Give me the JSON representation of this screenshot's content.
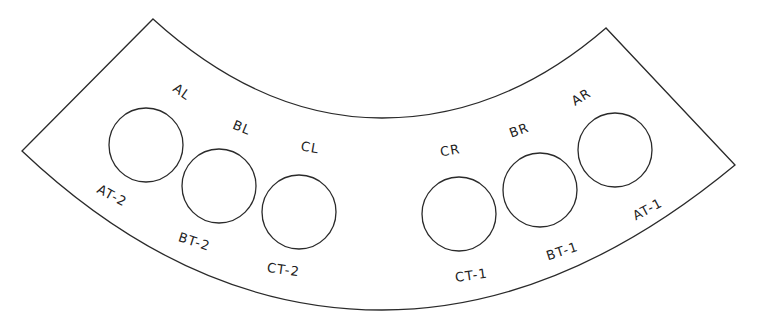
{
  "diagram": {
    "type": "curved-plate-layout",
    "stroke_color": "#2a2a2a",
    "background": "#ffffff",
    "plate": {
      "top_left": [
        153,
        19
      ],
      "left": [
        22,
        151
      ],
      "top_right": [
        606,
        28
      ],
      "right": [
        735,
        165
      ]
    },
    "holes": [
      {
        "id": "A-left",
        "cx": 146,
        "cy": 145,
        "r": 37,
        "top_label": "AL",
        "bottom_label": "AT-2"
      },
      {
        "id": "B-left",
        "cx": 219,
        "cy": 186,
        "r": 37,
        "top_label": "BL",
        "bottom_label": "BT-2"
      },
      {
        "id": "C-left",
        "cx": 299,
        "cy": 212,
        "r": 37,
        "top_label": "CL",
        "bottom_label": "CT-2"
      },
      {
        "id": "C-right",
        "cx": 459,
        "cy": 214,
        "r": 37,
        "top_label": "CR",
        "bottom_label": "CT-1"
      },
      {
        "id": "B-right",
        "cx": 540,
        "cy": 190,
        "r": 37,
        "top_label": "BR",
        "bottom_label": "BT-1"
      },
      {
        "id": "A-right",
        "cx": 615,
        "cy": 150,
        "r": 37,
        "top_label": "AR",
        "bottom_label": "AT-1"
      }
    ],
    "labels": {
      "AL": "AL",
      "BL": "BL",
      "CL": "CL",
      "CR": "CR",
      "BR": "BR",
      "AR": "AR",
      "AT2": "AT-2",
      "BT2": "BT-2",
      "CT2": "CT-2",
      "CT1": "CT-1",
      "BT1": "BT-1",
      "AT1": "AT-1"
    }
  }
}
